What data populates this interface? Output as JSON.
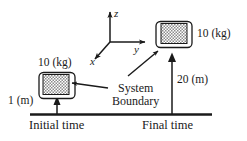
{
  "figure": {
    "name": "system-boundary-energy-diagram",
    "ink_color": "#1a1a1a",
    "background_color": "#ffffff",
    "block_fill_color": "#b3b3b3"
  },
  "axes": {
    "z_label": "z",
    "y_label": "y",
    "x_label": "x",
    "origin": {
      "x": 110,
      "y": 42
    }
  },
  "initial_state": {
    "mass_label": "10 (kg)",
    "height_label": "1 (m)",
    "time_label": "Initial time"
  },
  "final_state": {
    "mass_label": "10 (kg)",
    "height_label": "20 (m)",
    "time_label": "Final time"
  },
  "annotation": {
    "line1": "System",
    "line2": "Boundary"
  }
}
